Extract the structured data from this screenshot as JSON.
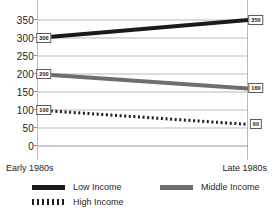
{
  "chart_data": {
    "type": "line",
    "title": "",
    "subtitle": "",
    "xlabel": "",
    "ylabel": "",
    "x": [
      "Early 1980s",
      "Late 1980s"
    ],
    "ylim": [
      0,
      350
    ],
    "yticks": [
      0,
      50,
      100,
      150,
      200,
      250,
      300,
      350
    ],
    "ytick_labels": [
      "0",
      "50",
      "100",
      "150",
      "200",
      "250",
      "300",
      "350"
    ],
    "grid": true,
    "legend_position": "bottom",
    "series": [
      {
        "name": "Low Income",
        "values": [
          300,
          350
        ],
        "point_labels": [
          "300",
          "350"
        ],
        "style": "solid",
        "color": "#1b1b1b",
        "width": 4
      },
      {
        "name": "Middle Income",
        "values": [
          200,
          160
        ],
        "point_labels": [
          "200",
          "160"
        ],
        "style": "solid",
        "color": "#6e6e6e",
        "width": 4
      },
      {
        "name": "High Income",
        "values": [
          100,
          60
        ],
        "point_labels": [
          "100",
          "60"
        ],
        "style": "dotted",
        "color": "#1b1b1b",
        "width": 3
      }
    ]
  },
  "axis": {
    "x_left_label": "Early 1980s",
    "x_right_label": "Late 1980s",
    "y_labels": {
      "t0": "0",
      "t1": "50",
      "t2": "100",
      "t3": "150",
      "t4": "200",
      "t5": "250",
      "t6": "300",
      "t7": "350"
    }
  },
  "callouts": {
    "low_start": "300",
    "low_end": "350",
    "middle_start": "200",
    "middle_end": "160",
    "high_start": "100",
    "high_end": "60"
  },
  "legend": {
    "items": [
      {
        "label": "Low Income",
        "swatch": "solid-dark"
      },
      {
        "label": "Middle Income",
        "swatch": "solid-gray"
      },
      {
        "label": "High Income",
        "swatch": "dotted"
      }
    ]
  },
  "colors": {
    "low_income": "#1b1b1b",
    "middle_income": "#6e6e6e",
    "high_income": "#1b1b1b",
    "gridline": "#b9b9b9",
    "background": "#ffffff"
  }
}
